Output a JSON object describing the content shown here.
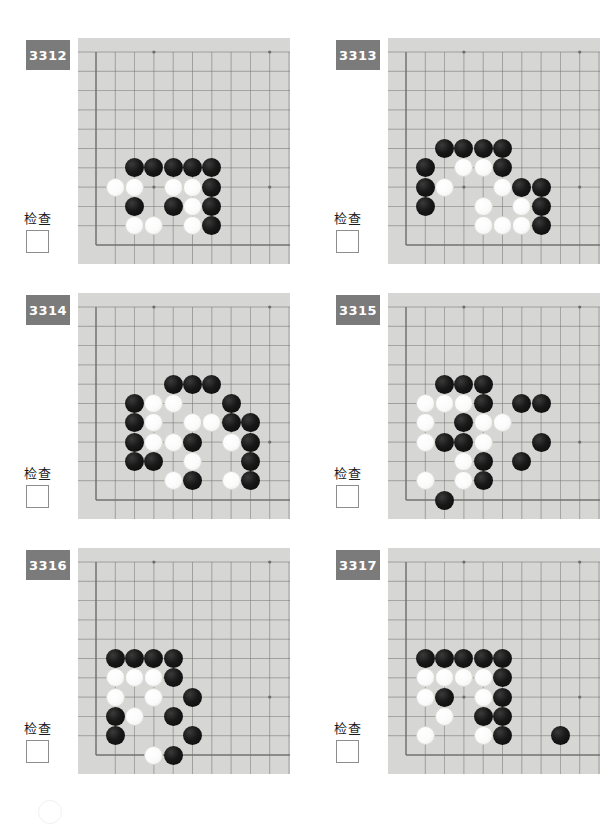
{
  "page": {
    "background_color": "#ffffff",
    "board_color": "#d6d6d4",
    "badge_color": "#7b7b7b",
    "grid_line_color": "#6e6e6e",
    "stone_black_color": "#111111",
    "stone_white_color": "#fdfdfd",
    "check_label": "检查",
    "footer_mark": "circle-outline"
  },
  "board_geometry": {
    "columns": 10,
    "rows": 11,
    "cell_size": 19.3,
    "origin_x": 18,
    "origin_y": 14,
    "stone_diameter": 19,
    "star_points": [
      [
        3,
        0
      ],
      [
        9,
        0
      ],
      [
        3,
        7
      ],
      [
        9,
        7
      ]
    ],
    "edge_left_col": 0,
    "edge_bottom_row": 10
  },
  "puzzles": [
    {
      "id": "3312",
      "check_label": "检查",
      "stones": [
        {
          "color": "black",
          "col": 2,
          "row": 6
        },
        {
          "color": "black",
          "col": 3,
          "row": 6
        },
        {
          "color": "black",
          "col": 4,
          "row": 6
        },
        {
          "color": "black",
          "col": 5,
          "row": 6
        },
        {
          "color": "black",
          "col": 6,
          "row": 6
        },
        {
          "color": "white",
          "col": 1,
          "row": 7
        },
        {
          "color": "white",
          "col": 2,
          "row": 7
        },
        {
          "color": "white",
          "col": 4,
          "row": 7
        },
        {
          "color": "white",
          "col": 5,
          "row": 7
        },
        {
          "color": "black",
          "col": 6,
          "row": 7
        },
        {
          "color": "black",
          "col": 2,
          "row": 8
        },
        {
          "color": "black",
          "col": 4,
          "row": 8
        },
        {
          "color": "white",
          "col": 5,
          "row": 8
        },
        {
          "color": "black",
          "col": 6,
          "row": 8
        },
        {
          "color": "white",
          "col": 2,
          "row": 9
        },
        {
          "color": "white",
          "col": 3,
          "row": 9
        },
        {
          "color": "white",
          "col": 5,
          "row": 9
        },
        {
          "color": "black",
          "col": 6,
          "row": 9
        }
      ]
    },
    {
      "id": "3313",
      "check_label": "检查",
      "stones": [
        {
          "color": "black",
          "col": 2,
          "row": 5
        },
        {
          "color": "black",
          "col": 3,
          "row": 5
        },
        {
          "color": "black",
          "col": 4,
          "row": 5
        },
        {
          "color": "black",
          "col": 5,
          "row": 5
        },
        {
          "color": "black",
          "col": 1,
          "row": 6
        },
        {
          "color": "white",
          "col": 3,
          "row": 6
        },
        {
          "color": "white",
          "col": 4,
          "row": 6
        },
        {
          "color": "black",
          "col": 5,
          "row": 6
        },
        {
          "color": "black",
          "col": 1,
          "row": 7
        },
        {
          "color": "white",
          "col": 2,
          "row": 7
        },
        {
          "color": "white",
          "col": 5,
          "row": 7
        },
        {
          "color": "black",
          "col": 6,
          "row": 7
        },
        {
          "color": "black",
          "col": 7,
          "row": 7
        },
        {
          "color": "black",
          "col": 1,
          "row": 8
        },
        {
          "color": "white",
          "col": 4,
          "row": 8
        },
        {
          "color": "white",
          "col": 6,
          "row": 8
        },
        {
          "color": "black",
          "col": 7,
          "row": 8
        },
        {
          "color": "white",
          "col": 4,
          "row": 9
        },
        {
          "color": "white",
          "col": 5,
          "row": 9
        },
        {
          "color": "white",
          "col": 6,
          "row": 9
        },
        {
          "color": "black",
          "col": 7,
          "row": 9
        }
      ]
    },
    {
      "id": "3314",
      "check_label": "检查",
      "stones": [
        {
          "color": "black",
          "col": 4,
          "row": 4
        },
        {
          "color": "black",
          "col": 5,
          "row": 4
        },
        {
          "color": "black",
          "col": 6,
          "row": 4
        },
        {
          "color": "black",
          "col": 2,
          "row": 5
        },
        {
          "color": "white",
          "col": 3,
          "row": 5
        },
        {
          "color": "white",
          "col": 4,
          "row": 5
        },
        {
          "color": "black",
          "col": 7,
          "row": 5
        },
        {
          "color": "black",
          "col": 2,
          "row": 6
        },
        {
          "color": "white",
          "col": 3,
          "row": 6
        },
        {
          "color": "white",
          "col": 5,
          "row": 6
        },
        {
          "color": "white",
          "col": 6,
          "row": 6
        },
        {
          "color": "black",
          "col": 7,
          "row": 6
        },
        {
          "color": "black",
          "col": 8,
          "row": 6
        },
        {
          "color": "black",
          "col": 2,
          "row": 7
        },
        {
          "color": "white",
          "col": 3,
          "row": 7
        },
        {
          "color": "white",
          "col": 4,
          "row": 7
        },
        {
          "color": "black",
          "col": 5,
          "row": 7
        },
        {
          "color": "white",
          "col": 7,
          "row": 7
        },
        {
          "color": "black",
          "col": 8,
          "row": 7
        },
        {
          "color": "black",
          "col": 2,
          "row": 8
        },
        {
          "color": "black",
          "col": 3,
          "row": 8
        },
        {
          "color": "white",
          "col": 5,
          "row": 8
        },
        {
          "color": "black",
          "col": 8,
          "row": 8
        },
        {
          "color": "white",
          "col": 4,
          "row": 9
        },
        {
          "color": "black",
          "col": 5,
          "row": 9
        },
        {
          "color": "white",
          "col": 7,
          "row": 9
        },
        {
          "color": "black",
          "col": 8,
          "row": 9
        }
      ]
    },
    {
      "id": "3315",
      "check_label": "检查",
      "stones": [
        {
          "color": "black",
          "col": 2,
          "row": 4
        },
        {
          "color": "black",
          "col": 3,
          "row": 4
        },
        {
          "color": "black",
          "col": 4,
          "row": 4
        },
        {
          "color": "white",
          "col": 1,
          "row": 5
        },
        {
          "color": "white",
          "col": 2,
          "row": 5
        },
        {
          "color": "white",
          "col": 3,
          "row": 5
        },
        {
          "color": "black",
          "col": 4,
          "row": 5
        },
        {
          "color": "black",
          "col": 6,
          "row": 5
        },
        {
          "color": "black",
          "col": 7,
          "row": 5
        },
        {
          "color": "white",
          "col": 1,
          "row": 6
        },
        {
          "color": "black",
          "col": 3,
          "row": 6
        },
        {
          "color": "white",
          "col": 4,
          "row": 6
        },
        {
          "color": "white",
          "col": 5,
          "row": 6
        },
        {
          "color": "white",
          "col": 1,
          "row": 7
        },
        {
          "color": "black",
          "col": 2,
          "row": 7
        },
        {
          "color": "black",
          "col": 3,
          "row": 7
        },
        {
          "color": "white",
          "col": 4,
          "row": 7
        },
        {
          "color": "black",
          "col": 7,
          "row": 7
        },
        {
          "color": "white",
          "col": 3,
          "row": 8
        },
        {
          "color": "black",
          "col": 4,
          "row": 8
        },
        {
          "color": "black",
          "col": 6,
          "row": 8
        },
        {
          "color": "white",
          "col": 1,
          "row": 9
        },
        {
          "color": "white",
          "col": 3,
          "row": 9
        },
        {
          "color": "black",
          "col": 4,
          "row": 9
        },
        {
          "color": "black",
          "col": 2,
          "row": 10
        }
      ]
    },
    {
      "id": "3316",
      "check_label": "检查",
      "stones": [
        {
          "color": "black",
          "col": 1,
          "row": 5
        },
        {
          "color": "black",
          "col": 2,
          "row": 5
        },
        {
          "color": "black",
          "col": 3,
          "row": 5
        },
        {
          "color": "black",
          "col": 4,
          "row": 5
        },
        {
          "color": "white",
          "col": 1,
          "row": 6
        },
        {
          "color": "white",
          "col": 2,
          "row": 6
        },
        {
          "color": "white",
          "col": 3,
          "row": 6
        },
        {
          "color": "black",
          "col": 4,
          "row": 6
        },
        {
          "color": "white",
          "col": 1,
          "row": 7
        },
        {
          "color": "white",
          "col": 3,
          "row": 7
        },
        {
          "color": "black",
          "col": 5,
          "row": 7
        },
        {
          "color": "black",
          "col": 1,
          "row": 8
        },
        {
          "color": "white",
          "col": 2,
          "row": 8
        },
        {
          "color": "black",
          "col": 4,
          "row": 8
        },
        {
          "color": "black",
          "col": 1,
          "row": 9
        },
        {
          "color": "black",
          "col": 5,
          "row": 9
        },
        {
          "color": "white",
          "col": 3,
          "row": 10
        },
        {
          "color": "black",
          "col": 4,
          "row": 10
        }
      ]
    },
    {
      "id": "3317",
      "check_label": "检查",
      "stones": [
        {
          "color": "black",
          "col": 1,
          "row": 5
        },
        {
          "color": "black",
          "col": 2,
          "row": 5
        },
        {
          "color": "black",
          "col": 3,
          "row": 5
        },
        {
          "color": "black",
          "col": 4,
          "row": 5
        },
        {
          "color": "black",
          "col": 5,
          "row": 5
        },
        {
          "color": "white",
          "col": 1,
          "row": 6
        },
        {
          "color": "white",
          "col": 2,
          "row": 6
        },
        {
          "color": "white",
          "col": 3,
          "row": 6
        },
        {
          "color": "white",
          "col": 4,
          "row": 6
        },
        {
          "color": "black",
          "col": 5,
          "row": 6
        },
        {
          "color": "white",
          "col": 1,
          "row": 7
        },
        {
          "color": "black",
          "col": 2,
          "row": 7
        },
        {
          "color": "white",
          "col": 4,
          "row": 7
        },
        {
          "color": "black",
          "col": 5,
          "row": 7
        },
        {
          "color": "white",
          "col": 2,
          "row": 8
        },
        {
          "color": "black",
          "col": 4,
          "row": 8
        },
        {
          "color": "black",
          "col": 5,
          "row": 8
        },
        {
          "color": "white",
          "col": 1,
          "row": 9
        },
        {
          "color": "white",
          "col": 4,
          "row": 9
        },
        {
          "color": "black",
          "col": 5,
          "row": 9
        },
        {
          "color": "black",
          "col": 8,
          "row": 9
        }
      ]
    }
  ]
}
